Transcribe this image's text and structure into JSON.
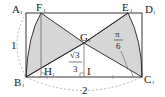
{
  "figure": {
    "type": "geometry",
    "shape": "rectangle A1B1C1D1 with two shaded sector regions",
    "colors": {
      "stroke": "#222222",
      "fill": "#d6d6d6",
      "dashed": "#888888",
      "background": "#ffffff"
    },
    "points": {
      "A1": {
        "label": "A",
        "sub": "1"
      },
      "B1": {
        "label": "B",
        "sub": "1"
      },
      "C1": {
        "label": "C",
        "sub": "1"
      },
      "D1": {
        "label": "D",
        "sub": "1"
      },
      "E1": {
        "label": "E",
        "sub": "1"
      },
      "F1": {
        "label": "F",
        "sub": "1"
      },
      "G1": {
        "label": "G",
        "sub": "1"
      },
      "H1": {
        "label": "H",
        "sub": "1"
      },
      "I": {
        "label": "I"
      }
    },
    "dimensions": {
      "height_label": "1",
      "width_label": "2"
    },
    "annotations": {
      "angle_num": "π",
      "angle_den": "6",
      "length_num": "√3",
      "length_den": "3"
    }
  }
}
